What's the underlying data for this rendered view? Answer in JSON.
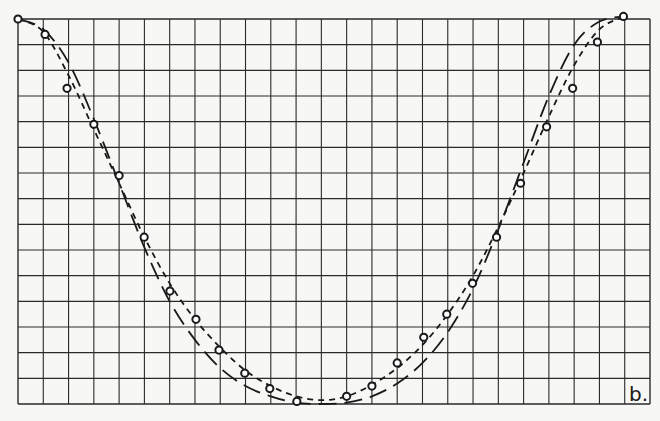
{
  "figure": {
    "panel_label": "b."
  },
  "chart_data": {
    "type": "scatter",
    "title": "",
    "xlabel": "",
    "ylabel": "",
    "panel_label": "b.",
    "grid": true,
    "grid_columns": 25,
    "grid_rows": 15,
    "xlim": [
      0,
      25
    ],
    "ylim": [
      0,
      15
    ],
    "legend": null,
    "series": [
      {
        "name": "measured points",
        "style": "open-circle",
        "x": [
          0,
          1.07,
          1.94,
          3.0,
          4.0,
          4.99,
          6.01,
          7.04,
          7.95,
          8.97,
          9.96,
          11.03,
          13.0,
          14.0,
          15.0,
          16.05,
          16.96,
          17.98,
          18.93,
          19.88,
          20.91,
          21.94,
          22.92,
          23.95
        ],
        "y": [
          15.0,
          14.4,
          12.3,
          10.9,
          8.9,
          6.5,
          4.4,
          3.3,
          2.1,
          1.2,
          0.6,
          0.1,
          0.3,
          0.7,
          1.6,
          2.6,
          3.5,
          4.7,
          6.5,
          8.6,
          10.8,
          12.3,
          14.1,
          15.1
        ]
      },
      {
        "name": "fit curve (short dashes)",
        "style": "short-dash",
        "x": [
          0,
          1,
          2,
          3,
          4,
          5,
          6,
          7,
          8,
          9,
          10,
          11,
          12,
          13,
          14,
          15,
          16,
          17,
          18,
          19,
          20,
          21,
          22,
          23,
          24
        ],
        "y": [
          15.0,
          14.5,
          12.8,
          10.7,
          8.6,
          6.5,
          4.7,
          3.3,
          2.2,
          1.3,
          0.7,
          0.3,
          0.15,
          0.3,
          0.75,
          1.4,
          2.3,
          3.5,
          5.0,
          6.9,
          9.0,
          11.2,
          13.2,
          14.6,
          15.1
        ]
      },
      {
        "name": "fit curve (long dashes)",
        "style": "long-dash",
        "x": [
          0,
          1,
          2,
          3,
          4,
          5,
          6,
          7,
          8,
          9,
          10,
          11,
          12,
          13,
          14,
          15,
          16,
          17,
          18,
          19,
          20,
          21,
          22,
          23,
          24
        ],
        "y": [
          15.0,
          14.6,
          13.3,
          11.1,
          8.6,
          6.1,
          4.0,
          2.5,
          1.4,
          0.7,
          0.3,
          0.05,
          0.0,
          0.05,
          0.3,
          0.8,
          1.6,
          2.8,
          4.5,
          6.8,
          9.4,
          12.0,
          14.0,
          14.9,
          15.1
        ]
      }
    ],
    "colors": {
      "background": "#f7f7f5",
      "grid": "#2a2a2a",
      "ink": "#1a1a1a"
    }
  }
}
